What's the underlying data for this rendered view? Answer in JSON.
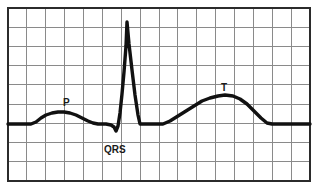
{
  "figure": {
    "kind": "ecg-waveform-diagram",
    "background_color": "#ffffff",
    "grid_color": "#8a8a8a",
    "grid_minor_color": "#d9d9d9",
    "border_color": "#2b2b2b",
    "trace_color": "#111111"
  },
  "grid": {
    "left": 8,
    "top": 8,
    "right": 310,
    "bottom": 181,
    "columns": 16,
    "rows": 9,
    "cell_width": 18.875,
    "cell_height": 19.222,
    "border_width": 2,
    "line_width": 1
  },
  "labels": [
    {
      "id": "p-wave-label",
      "text": "P",
      "x": 63,
      "y": 106,
      "font_size": 10
    },
    {
      "id": "qrs-complex-label",
      "text": "QRS",
      "x": 104,
      "y": 153,
      "font_size": 10
    },
    {
      "id": "t-wave-label",
      "text": "T",
      "x": 221,
      "y": 91,
      "font_size": 10
    }
  ],
  "chart_data": {
    "type": "line",
    "title": "",
    "xlabel": "",
    "ylabel": "",
    "grid": true,
    "legend": "none",
    "xlim": [
      8,
      310
    ],
    "ylim": [
      181,
      8
    ],
    "baseline_y": 124,
    "trace_width": 3.4,
    "annotations": [
      "P",
      "QRS",
      "T"
    ],
    "series": [
      {
        "name": "ecg-trace",
        "color": "#111111",
        "points": [
          [
            8,
            124
          ],
          [
            20,
            124
          ],
          [
            31,
            124
          ],
          [
            36,
            122
          ],
          [
            41,
            118
          ],
          [
            46,
            115
          ],
          [
            52,
            113
          ],
          [
            58,
            112
          ],
          [
            64,
            112
          ],
          [
            70,
            113
          ],
          [
            76,
            115
          ],
          [
            82,
            118
          ],
          [
            88,
            121
          ],
          [
            93,
            123
          ],
          [
            98,
            124
          ],
          [
            106,
            124
          ],
          [
            111,
            125
          ],
          [
            114,
            127
          ],
          [
            116,
            131
          ],
          [
            118,
            126
          ],
          [
            120,
            113
          ],
          [
            122,
            94
          ],
          [
            124,
            72
          ],
          [
            126,
            46
          ],
          [
            127,
            22
          ],
          [
            129,
            44
          ],
          [
            132,
            70
          ],
          [
            135,
            95
          ],
          [
            138,
            115
          ],
          [
            140,
            124
          ],
          [
            152,
            124
          ],
          [
            163,
            124
          ],
          [
            170,
            121
          ],
          [
            178,
            116
          ],
          [
            186,
            111
          ],
          [
            194,
            106
          ],
          [
            202,
            101
          ],
          [
            210,
            98
          ],
          [
            218,
            96
          ],
          [
            225,
            95
          ],
          [
            233,
            96
          ],
          [
            240,
            99
          ],
          [
            247,
            104
          ],
          [
            254,
            111
          ],
          [
            261,
            118
          ],
          [
            267,
            123
          ],
          [
            272,
            124
          ],
          [
            285,
            124
          ],
          [
            300,
            124
          ],
          [
            310,
            124
          ]
        ]
      }
    ]
  }
}
